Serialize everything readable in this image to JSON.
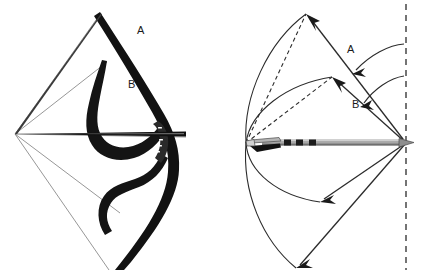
{
  "figure": {
    "title": "",
    "background_color": "#ffffff",
    "width": 422,
    "height": 274,
    "panels": [
      {
        "id": "left-panel",
        "name": "bow-drawn-photograph-diagram",
        "description": "Photographic silhouette of a recurve bow with string drawn, showing two string/limb positions",
        "labels": [
          {
            "id": "left-label-a",
            "text": "A",
            "x": 137,
            "y": 34
          },
          {
            "id": "left-label-b",
            "text": "B",
            "x": 128,
            "y": 88
          }
        ]
      },
      {
        "id": "right-panel",
        "name": "bow-limb-deflection-schematic",
        "description": "Line schematic of arrow on string with limb tip travel arcs and deflection arrows relative to a vertical dashed reference line",
        "labels": [
          {
            "id": "right-label-a",
            "text": "A",
            "x": 347,
            "y": 53
          },
          {
            "id": "right-label-b",
            "text": "B",
            "x": 352,
            "y": 108
          }
        ]
      }
    ],
    "colors": {
      "ink": "#1a1a1a",
      "line": "#2b2b2b",
      "thin_line": "#555555",
      "bow_limb": "#111111",
      "arrow_shaft": "#9a9a9a",
      "arrow_shaft_dark": "#6f6f6f",
      "arrow_fletch": "#3a3a3a",
      "arrow_nock_light": "#c9c9c9",
      "dashed_reference": "#3a3a3a",
      "background": "#ffffff"
    },
    "icon_names": {
      "reference_line": "vertical-dashed-reference-line-icon",
      "arrow": "archery-arrow-icon",
      "bow": "recurve-bow-icon",
      "deflection_arrow": "curved-deflection-arrow-icon"
    }
  }
}
